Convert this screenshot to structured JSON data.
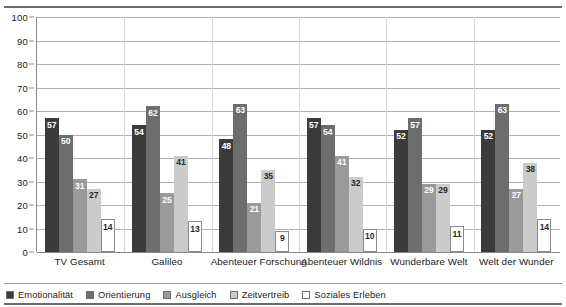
{
  "chart_data": {
    "type": "bar",
    "title": "",
    "xlabel": "",
    "ylabel": "",
    "ylim": [
      0,
      100
    ],
    "ytick_step": 10,
    "yticks": [
      100,
      90,
      80,
      70,
      60,
      50,
      40,
      30,
      20,
      10,
      0
    ],
    "grid": "horizontal",
    "legend_position": "bottom",
    "categories": [
      "TV Gesamt",
      "Galileo",
      "Abenteuer Forschung",
      "Abenteuer Wildnis",
      "Wunderbare Welt",
      "Welt der Wunder"
    ],
    "series": [
      {
        "name": "Emotionalität",
        "color": "#3b3b3b",
        "values": [
          57,
          54,
          48,
          57,
          52,
          52
        ]
      },
      {
        "name": "Orientierung",
        "color": "#6d6d6d",
        "values": [
          50,
          62,
          63,
          54,
          57,
          63
        ]
      },
      {
        "name": "Ausgleich",
        "color": "#9a9a9a",
        "values": [
          31,
          25,
          21,
          41,
          29,
          27
        ]
      },
      {
        "name": "Zeitvertreib",
        "color": "#cbcbcb",
        "values": [
          27,
          41,
          35,
          32,
          29,
          38
        ]
      },
      {
        "name": "Soziales Erleben",
        "color": "#ffffff",
        "values": [
          14,
          13,
          9,
          10,
          11,
          14
        ]
      }
    ]
  },
  "colors": {
    "rule": "#6b6b6b",
    "gridline": "#b0b0b0",
    "axis": "#8a8a8a",
    "group_separator": "#d8d8d8",
    "text": "#1a1a1a"
  }
}
